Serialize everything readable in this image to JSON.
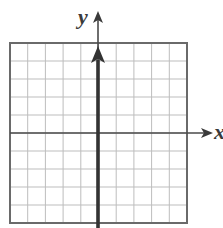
{
  "chart_data": {
    "type": "line",
    "title": "",
    "xlabel": "x",
    "ylabel": "y",
    "grid": true,
    "xlim": [
      -5,
      5
    ],
    "ylim": [
      -5,
      5
    ],
    "grid_cells": {
      "columns": 10,
      "rows": 10
    },
    "axes": {
      "x_axis_arrow": "right",
      "y_axis_arrow": "up"
    },
    "series": [
      {
        "name": "vertical line on y-axis",
        "description": "Bold vertical line along x = 0 with arrow pointing up",
        "x": [
          0,
          0
        ],
        "y": [
          -5,
          5
        ]
      }
    ],
    "tick_labels": {
      "x": [],
      "y": []
    },
    "legend": null
  },
  "labels": {
    "y_axis": "y",
    "x_axis": "x"
  },
  "colors": {
    "grid": "#b8b8b8",
    "border": "#6a6a6a",
    "axis": "#4a4a4a",
    "line": "#3a3a3a"
  }
}
